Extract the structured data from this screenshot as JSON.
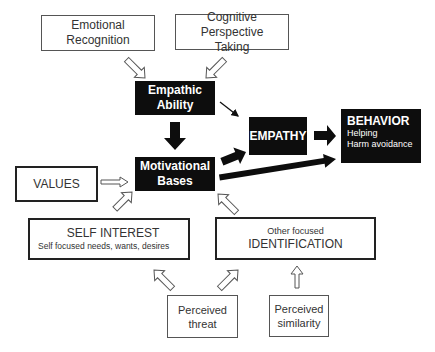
{
  "diagram": {
    "nodes": {
      "emotional_recognition": {
        "line1": "Emotional",
        "line2": "Recognition"
      },
      "cognitive_perspective": {
        "line1": "Cognitive Perspective",
        "line2": "Taking"
      },
      "empathic_ability": {
        "line1": "Empathic",
        "line2": "Ability"
      },
      "motivational_bases": {
        "line1": "Motivational",
        "line2": "Bases"
      },
      "empathy": {
        "label": "EMPATHY"
      },
      "behavior": {
        "title": "BEHAVIOR",
        "item1": "Helping",
        "item2": "Harm avoidance"
      },
      "values": {
        "label": "VALUES"
      },
      "self_interest": {
        "title": "SELF INTEREST",
        "subtitle": "Self focused needs, wants, desires"
      },
      "identification": {
        "subtitle": "Other focused",
        "title": "IDENTIFICATION"
      },
      "perceived_threat": {
        "line1": "Perceived",
        "line2": "threat"
      },
      "perceived_similarity": {
        "line1": "Perceived",
        "line2": "similarity"
      }
    },
    "edges": [
      {
        "from": "Emotional Recognition",
        "to": "Empathic Ability",
        "style": "hollow"
      },
      {
        "from": "Cognitive Perspective Taking",
        "to": "Empathic Ability",
        "style": "hollow"
      },
      {
        "from": "Empathic Ability",
        "to": "Motivational Bases",
        "style": "solid-thick"
      },
      {
        "from": "Empathic Ability",
        "to": "EMPATHY",
        "style": "thin"
      },
      {
        "from": "Motivational Bases",
        "to": "EMPATHY",
        "style": "solid-thick"
      },
      {
        "from": "Motivational Bases",
        "to": "BEHAVIOR",
        "style": "solid-thick"
      },
      {
        "from": "EMPATHY",
        "to": "BEHAVIOR",
        "style": "solid-thick"
      },
      {
        "from": "VALUES",
        "to": "Motivational Bases",
        "style": "hollow"
      },
      {
        "from": "SELF INTEREST",
        "to": "Motivational Bases",
        "style": "hollow"
      },
      {
        "from": "IDENTIFICATION",
        "to": "Motivational Bases",
        "style": "hollow"
      },
      {
        "from": "Perceived threat",
        "to": "SELF INTEREST",
        "style": "hollow"
      },
      {
        "from": "Perceived threat",
        "to": "IDENTIFICATION",
        "style": "hollow"
      },
      {
        "from": "Perceived similarity",
        "to": "IDENTIFICATION",
        "style": "hollow"
      }
    ],
    "colors": {
      "black_box": "#0d0d0d",
      "border": "#555555",
      "text": "#333333"
    }
  }
}
